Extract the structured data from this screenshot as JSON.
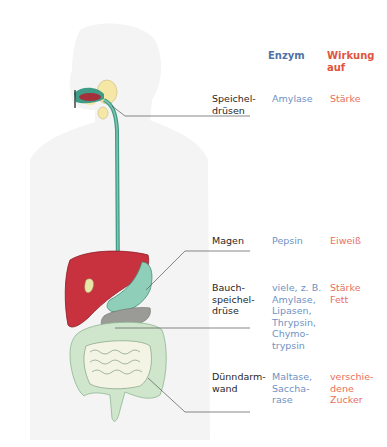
{
  "headers": {
    "enzyme": "Enzym",
    "effect": "Wirkung\nauf"
  },
  "rows": [
    {
      "organ": "Speichel-\ndrüsen",
      "enzyme": "Amylase",
      "effect": "Stärke"
    },
    {
      "organ": "Magen",
      "enzyme": "Pepsin",
      "effect": "Eiweiß"
    },
    {
      "organ": "Bauch-\nspeichel-\ndrüse",
      "enzyme": "viele, z. B.\nAmylase,\nLipasen,\nThrypsin,\nChymo-\ntrypsin",
      "effect": "Stärke\nFett"
    },
    {
      "organ": "Dünndarm-\nwand",
      "enzyme": "Maltase,\nSaccha-\nrase",
      "effect": "verschie-\ndene\nZucker"
    }
  ],
  "colors": {
    "enzyme_header": "#4f73a6",
    "enzyme_text": "#6f92c4",
    "effect_text": "#e8705c",
    "organ_text": "#1f1f1f",
    "silhouette": "#f3f4f3",
    "liver": "#c8323f",
    "stomach": "#8fcfba",
    "esophagus": "#3f9b86",
    "salivary_gland": "#f5e7a5",
    "pancreas": "#9a9a96",
    "intestine": "#cfe6cc"
  }
}
